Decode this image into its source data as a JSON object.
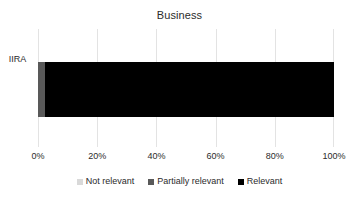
{
  "chart_data": {
    "type": "bar",
    "orientation": "horizontal",
    "stacked": true,
    "normalized": true,
    "title": "Business",
    "xlabel": "",
    "ylabel": "",
    "categories": [
      "IIRA"
    ],
    "series": [
      {
        "name": "Not relevant",
        "values": [
          0
        ],
        "color": "#d9d9d9"
      },
      {
        "name": "Partially relevant",
        "values": [
          2.4
        ],
        "color": "#595959"
      },
      {
        "name": "Relevant",
        "values": [
          97.6
        ],
        "color": "#000000"
      }
    ],
    "xlim": [
      0,
      100
    ],
    "xticks": [
      0,
      20,
      40,
      60,
      80,
      100
    ],
    "xtick_labels": [
      "0%",
      "20%",
      "40%",
      "60%",
      "80%",
      "100%"
    ],
    "grid": true,
    "grid_axis": "x",
    "grid_color": "#e3e3e3",
    "legend_position": "bottom",
    "legend_entries": [
      "Not relevant",
      "Partially relevant",
      "Relevant"
    ],
    "background": "#ffffff",
    "text_color": "#2b2b2b"
  }
}
